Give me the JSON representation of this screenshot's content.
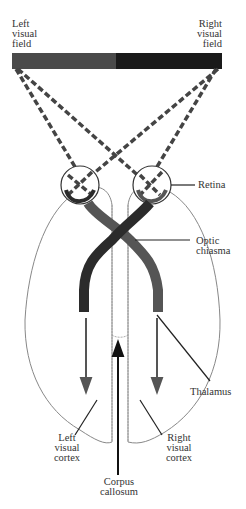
{
  "labels": {
    "left_visual_field": [
      "Left",
      "visual",
      "field"
    ],
    "right_visual_field": [
      "Right",
      "visual",
      "field"
    ],
    "retina": "Retina",
    "optic_chiasma": [
      "Optic",
      "chiasma"
    ],
    "thalamus": "Thalamus",
    "left_visual_cortex": [
      "Left",
      "visual",
      "cortex"
    ],
    "right_visual_cortex": [
      "Right",
      "visual",
      "cortex"
    ],
    "corpus_callosum": [
      "Corpus",
      "callosum"
    ]
  },
  "colors": {
    "left_field": "#4a4a4a",
    "right_field": "#1a1a1a",
    "left_pathway": "#2b2b2b",
    "right_pathway": "#555555",
    "outline": "#777777"
  }
}
